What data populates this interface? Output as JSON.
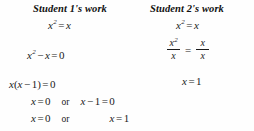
{
  "document": {
    "type": "math-worksheet-comparison",
    "background_color": "#fefefe",
    "text_color": "#1a1a1a"
  },
  "columns": {
    "left": {
      "header": "Student 1's work",
      "lines": [
        {
          "id": "l1",
          "text": "x² = x"
        },
        {
          "id": "l2",
          "text": "x² − x = 0"
        },
        {
          "id": "l3",
          "text": "x(x − 1) = 0"
        },
        {
          "id": "l4",
          "text": "x = 0   or   x − 1 = 0"
        },
        {
          "id": "l5",
          "text": "x = 0   or   x = 1"
        }
      ],
      "tokens": {
        "var_x": "x",
        "exp_2": "2",
        "equals": "=",
        "minus": "−",
        "zero": "0",
        "one": "1",
        "or": "or",
        "paren_open": "(",
        "paren_close": ")"
      }
    },
    "right": {
      "header": "Student 2's work",
      "lines": [
        {
          "id": "r1",
          "text": "x² = x"
        },
        {
          "id": "r2",
          "text": "x²/x = x/x"
        },
        {
          "id": "r3",
          "text": "x = 1"
        }
      ],
      "fraction": {
        "left_numerator": "x²",
        "left_denominator": "x",
        "right_numerator": "x",
        "right_denominator": "x",
        "relation": "="
      },
      "tokens": {
        "var_x": "x",
        "exp_2": "2",
        "equals": "=",
        "one": "1"
      }
    }
  }
}
